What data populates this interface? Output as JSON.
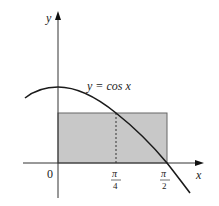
{
  "diagram": {
    "type": "function-plot",
    "function_label": "y = cos x",
    "axes": {
      "x_label": "x",
      "y_label": "y",
      "origin_label": "0"
    },
    "ticks": [
      {
        "numerator": "π",
        "denominator": "4",
        "value": "pi/4"
      },
      {
        "numerator": "π",
        "denominator": "2",
        "value": "pi/2"
      }
    ],
    "shaded_rectangle": {
      "x_from": "0",
      "x_to": "π/2",
      "height": "cos(π/4)",
      "fill_color": "#c8c8c8"
    },
    "dashed_line": {
      "at_x": "π/4"
    },
    "colors": {
      "curve": "#1a1a1a",
      "axes": "#333333",
      "rect_fill": "#c8c8c8",
      "rect_stroke": "#555555"
    }
  }
}
